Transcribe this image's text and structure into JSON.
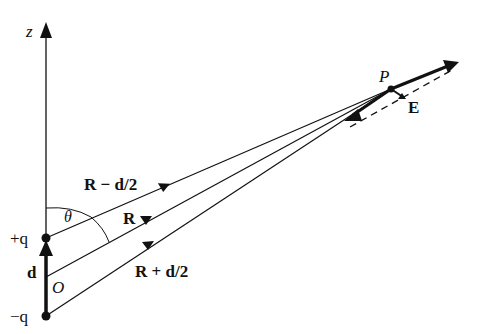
{
  "figure": {
    "axis": {
      "label": "z"
    },
    "charges": {
      "positive": "+q",
      "negative": "−q",
      "origin": "O",
      "separation": "d"
    },
    "vectors": {
      "upper": "R − d/2",
      "middle": "R",
      "lower": "R + d/2"
    },
    "angle": "θ",
    "point": "P",
    "field": "E",
    "colors": {
      "ink": "#111111",
      "background": "#ffffff"
    }
  }
}
